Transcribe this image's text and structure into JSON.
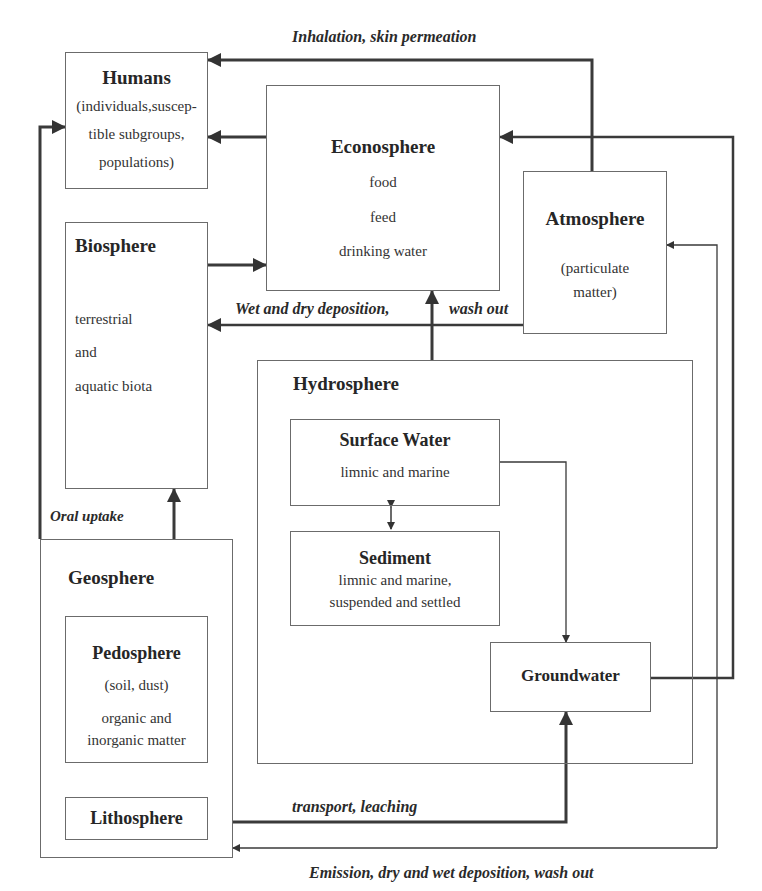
{
  "flows": {
    "inhalation": "Inhalation, skin permeation",
    "deposition_left": "Wet and dry deposition,",
    "deposition_right": "wash out",
    "oral_uptake": "Oral uptake",
    "transport": "transport, leaching",
    "emission": "Emission, dry and wet deposition, wash out"
  },
  "boxes": {
    "humans": {
      "title": "Humans",
      "lines": [
        "(individuals,suscep-",
        "tible subgroups,",
        "populations)"
      ]
    },
    "econosphere": {
      "title": "Econosphere",
      "lines": [
        "food",
        "feed",
        "drinking water"
      ]
    },
    "atmosphere": {
      "title": "Atmosphere",
      "lines": [
        "(particulate",
        "matter)"
      ]
    },
    "biosphere": {
      "title": "Biosphere",
      "lines": [
        "terrestrial",
        "and",
        "aquatic biota"
      ]
    },
    "hydrosphere": {
      "title": "Hydrosphere"
    },
    "surface_water": {
      "title": "Surface Water",
      "lines": [
        "limnic and marine"
      ]
    },
    "sediment": {
      "title": "Sediment",
      "lines": [
        "limnic and marine,",
        "suspended and settled"
      ]
    },
    "groundwater": {
      "title": "Groundwater"
    },
    "geosphere": {
      "title": "Geosphere"
    },
    "pedosphere": {
      "title": "Pedosphere",
      "lines": [
        "(soil, dust)",
        "organic and",
        "inorganic matter"
      ]
    },
    "lithosphere": {
      "title": "Lithosphere"
    }
  }
}
